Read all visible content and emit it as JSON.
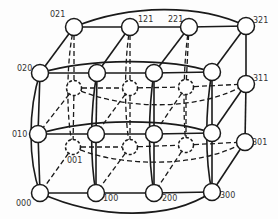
{
  "diagram": {
    "colors": {
      "stroke": "#1a1a1a",
      "node_fill": "#ffffff",
      "label": "#333333"
    },
    "nodes": [
      {
        "id": "021",
        "x": 74,
        "y": 27,
        "hidden": false,
        "label": "021",
        "lx": 50,
        "ly": 17
      },
      {
        "id": "121",
        "x": 130,
        "y": 27,
        "hidden": false,
        "label": "121",
        "lx": 138,
        "ly": 22
      },
      {
        "id": "221",
        "x": 189,
        "y": 27,
        "hidden": false,
        "label": "221",
        "lx": 168,
        "ly": 22
      },
      {
        "id": "321",
        "x": 246,
        "y": 26,
        "hidden": false,
        "label": "321",
        "lx": 253,
        "ly": 23
      },
      {
        "id": "020",
        "x": 40,
        "y": 73,
        "hidden": false,
        "label": "020",
        "lx": 17,
        "ly": 71
      },
      {
        "id": "120",
        "x": 97,
        "y": 73,
        "hidden": false,
        "label": "",
        "lx": 0,
        "ly": 0
      },
      {
        "id": "220",
        "x": 154,
        "y": 73,
        "hidden": false,
        "label": "",
        "lx": 0,
        "ly": 0
      },
      {
        "id": "320",
        "x": 212,
        "y": 72,
        "hidden": false,
        "label": "",
        "lx": 0,
        "ly": 0
      },
      {
        "id": "011",
        "x": 74,
        "y": 88,
        "hidden": true,
        "label": "",
        "lx": 0,
        "ly": 0
      },
      {
        "id": "111",
        "x": 130,
        "y": 88,
        "hidden": true,
        "label": "",
        "lx": 0,
        "ly": 0
      },
      {
        "id": "211",
        "x": 186,
        "y": 87,
        "hidden": true,
        "label": "",
        "lx": 0,
        "ly": 0
      },
      {
        "id": "311",
        "x": 246,
        "y": 84,
        "hidden": false,
        "label": "311",
        "lx": 253,
        "ly": 81
      },
      {
        "id": "010",
        "x": 38,
        "y": 134,
        "hidden": false,
        "label": "010",
        "lx": 12,
        "ly": 137
      },
      {
        "id": "110",
        "x": 96,
        "y": 134,
        "hidden": false,
        "label": "",
        "lx": 0,
        "ly": 0
      },
      {
        "id": "210",
        "x": 154,
        "y": 134,
        "hidden": false,
        "label": "",
        "lx": 0,
        "ly": 0
      },
      {
        "id": "310",
        "x": 212,
        "y": 133,
        "hidden": false,
        "label": "",
        "lx": 0,
        "ly": 0
      },
      {
        "id": "001",
        "x": 73,
        "y": 147,
        "hidden": true,
        "label": "001",
        "lx": 67,
        "ly": 163
      },
      {
        "id": "101",
        "x": 130,
        "y": 147,
        "hidden": true,
        "label": "",
        "lx": 0,
        "ly": 0
      },
      {
        "id": "201",
        "x": 186,
        "y": 145,
        "hidden": true,
        "label": "",
        "lx": 0,
        "ly": 0
      },
      {
        "id": "301",
        "x": 245,
        "y": 142,
        "hidden": false,
        "label": "301",
        "lx": 252,
        "ly": 145
      },
      {
        "id": "000",
        "x": 40,
        "y": 193,
        "hidden": false,
        "label": "000",
        "lx": 16,
        "ly": 206
      },
      {
        "id": "100",
        "x": 96,
        "y": 193,
        "hidden": false,
        "label": "100",
        "lx": 103,
        "ly": 201
      },
      {
        "id": "200",
        "x": 154,
        "y": 193,
        "hidden": false,
        "label": "200",
        "lx": 162,
        "ly": 201
      },
      {
        "id": "300",
        "x": 212,
        "y": 192,
        "hidden": false,
        "label": "300",
        "lx": 220,
        "ly": 198
      }
    ],
    "edges": [
      {
        "a": "021",
        "b": "121",
        "h": false
      },
      {
        "a": "121",
        "b": "221",
        "h": false
      },
      {
        "a": "221",
        "b": "321",
        "h": false
      },
      {
        "a": "020",
        "b": "120",
        "h": false
      },
      {
        "a": "120",
        "b": "220",
        "h": false
      },
      {
        "a": "220",
        "b": "320",
        "h": false
      },
      {
        "a": "010",
        "b": "110",
        "h": false
      },
      {
        "a": "110",
        "b": "210",
        "h": false
      },
      {
        "a": "210",
        "b": "310",
        "h": false
      },
      {
        "a": "000",
        "b": "100",
        "h": false
      },
      {
        "a": "100",
        "b": "200",
        "h": false
      },
      {
        "a": "200",
        "b": "300",
        "h": false
      },
      {
        "a": "020",
        "b": "010",
        "h": false
      },
      {
        "a": "010",
        "b": "000",
        "h": false
      },
      {
        "a": "120",
        "b": "110",
        "h": false
      },
      {
        "a": "110",
        "b": "100",
        "h": false
      },
      {
        "a": "220",
        "b": "210",
        "h": false
      },
      {
        "a": "210",
        "b": "200",
        "h": false
      },
      {
        "a": "320",
        "b": "310",
        "h": false
      },
      {
        "a": "310",
        "b": "300",
        "h": false
      },
      {
        "a": "321",
        "b": "311",
        "h": false
      },
      {
        "a": "311",
        "b": "301",
        "h": false
      },
      {
        "a": "021",
        "b": "020",
        "h": false
      },
      {
        "a": "121",
        "b": "120",
        "h": false
      },
      {
        "a": "221",
        "b": "220",
        "h": false
      },
      {
        "a": "321",
        "b": "320",
        "h": false
      },
      {
        "a": "311",
        "b": "310",
        "h": false
      },
      {
        "a": "301",
        "b": "300",
        "h": false
      },
      {
        "a": "011",
        "b": "111",
        "h": true
      },
      {
        "a": "111",
        "b": "211",
        "h": true
      },
      {
        "a": "211",
        "b": "311",
        "h": true
      },
      {
        "a": "001",
        "b": "101",
        "h": true
      },
      {
        "a": "101",
        "b": "201",
        "h": true
      },
      {
        "a": "201",
        "b": "301",
        "h": true
      },
      {
        "a": "021",
        "b": "011",
        "h": true
      },
      {
        "a": "011",
        "b": "001",
        "h": true
      },
      {
        "a": "121",
        "b": "111",
        "h": true
      },
      {
        "a": "111",
        "b": "101",
        "h": true
      },
      {
        "a": "221",
        "b": "211",
        "h": true
      },
      {
        "a": "211",
        "b": "201",
        "h": true
      },
      {
        "a": "011",
        "b": "010",
        "h": true
      },
      {
        "a": "001",
        "b": "000",
        "h": true
      },
      {
        "a": "111",
        "b": "110",
        "h": true
      },
      {
        "a": "101",
        "b": "100",
        "h": true
      },
      {
        "a": "211",
        "b": "210",
        "h": true
      },
      {
        "a": "201",
        "b": "200",
        "h": true
      }
    ],
    "curves": [
      {
        "d": "M74,27 C130,4 200,4 246,26",
        "h": false
      },
      {
        "d": "M40,73 C90,58 170,58 212,72",
        "h": false
      },
      {
        "d": "M38,134 C90,118 170,118 212,133",
        "h": false
      },
      {
        "d": "M40,193 C100,220 170,220 212,192",
        "h": false
      },
      {
        "d": "M40,73 C28,110 28,160 40,193",
        "h": false
      },
      {
        "d": "M97,73 C90,110 90,160 96,193",
        "h": false
      },
      {
        "d": "M154,73 C148,110 148,160 154,193",
        "h": false
      },
      {
        "d": "M212,72 C205,110 205,160 212,192",
        "h": false
      },
      {
        "d": "M74,88 C120,110 200,112 246,84",
        "h": true
      },
      {
        "d": "M73,147 C120,168 200,168 245,142",
        "h": true
      },
      {
        "d": "M74,27 C66,60 66,120 73,147",
        "h": true
      },
      {
        "d": "M130,27 C124,60 124,120 130,147",
        "h": true
      },
      {
        "d": "M189,27 C183,60 183,120 186,145",
        "h": true
      }
    ]
  }
}
